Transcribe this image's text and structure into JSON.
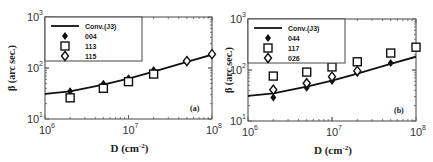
{
  "chart_data": [
    {
      "type": "scatter",
      "panel": "(a)",
      "xlabel": "D (cm-2)",
      "ylabel": "β (arc sec.)",
      "xscale": "log",
      "yscale": "log",
      "xlim": [
        1000000,
        100000000
      ],
      "ylim": [
        10,
        1000
      ],
      "xticks": [
        "10^6",
        "10^7",
        "10^8"
      ],
      "yticks": [
        "10^1",
        "10^2",
        "10^3"
      ],
      "legend_position": "upper left",
      "series": [
        {
          "name": "Conv.(J3)",
          "kind": "line",
          "x": [
            1000000,
            2000000,
            5000000,
            10000000,
            20000000,
            50000000,
            100000000
          ],
          "y": [
            31,
            35,
            47,
            62,
            85,
            132,
            182
          ]
        },
        {
          "name": "004",
          "marker": "filled-diamond",
          "x": [
            2000000,
            5000000,
            10000000,
            20000000
          ],
          "y": [
            35,
            49,
            63,
            91
          ]
        },
        {
          "name": "113",
          "marker": "open-square",
          "x": [
            2000000,
            5000000,
            10000000,
            20000000
          ],
          "y": [
            26,
            40,
            54,
            76
          ]
        },
        {
          "name": "115",
          "marker": "open-diamond",
          "x": [
            50000000,
            100000000
          ],
          "y": [
            137,
            187
          ]
        }
      ]
    },
    {
      "type": "scatter",
      "panel": "(b)",
      "xlabel": "D (cm-2)",
      "ylabel": "β (arc sec.)",
      "xscale": "log",
      "yscale": "log",
      "xlim": [
        1000000,
        100000000
      ],
      "ylim": [
        10,
        1000
      ],
      "xticks": [
        "10^6",
        "10^7",
        "10^8"
      ],
      "yticks": [
        "10^1",
        "10^2",
        "10^3"
      ],
      "legend_position": "upper left",
      "series": [
        {
          "name": "Conv.(J3)",
          "kind": "line",
          "x": [
            1000000,
            2000000,
            5000000,
            10000000,
            20000000,
            50000000,
            100000000
          ],
          "y": [
            31,
            35,
            47,
            62,
            85,
            132,
            182
          ]
        },
        {
          "name": "044",
          "marker": "filled-diamond",
          "x": [
            2000000,
            5000000,
            10000000,
            20000000,
            50000000
          ],
          "y": [
            29,
            45,
            61,
            87,
            137
          ]
        },
        {
          "name": "117",
          "marker": "open-square",
          "x": [
            2000000,
            5000000,
            10000000,
            20000000,
            50000000,
            100000000
          ],
          "y": [
            76,
            91,
            115,
            145,
            215,
            280
          ]
        },
        {
          "name": "026",
          "marker": "open-diamond",
          "x": [
            2000000,
            5000000,
            10000000,
            20000000
          ],
          "y": [
            41,
            55,
            74,
            96
          ]
        }
      ]
    }
  ],
  "labels": {
    "ylabel": "β (arc sec.)",
    "xlabel_base": "D (cm",
    "xlabel_exp": "-2",
    "xlabel_close": ")",
    "panel_a": "(a)",
    "panel_b": "(b)",
    "tick_base": "10",
    "x_exps": [
      "6",
      "7",
      "8"
    ],
    "y_exps": [
      "1",
      "2",
      "3"
    ]
  },
  "legend_a": [
    "Conv.(J3)",
    "004",
    "113",
    "115"
  ],
  "legend_b": [
    "Conv.(J3)",
    "044",
    "117",
    "026"
  ]
}
